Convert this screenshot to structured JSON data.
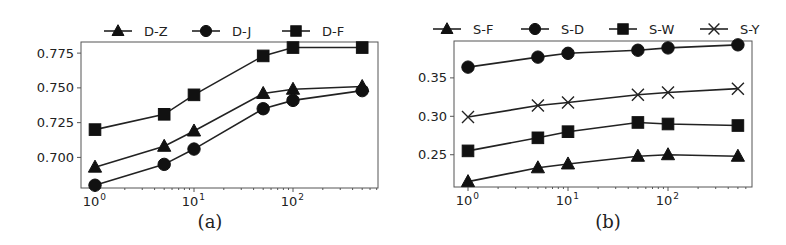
{
  "chart_data": [
    {
      "id": "a",
      "type": "line",
      "caption": "(a)",
      "title": "",
      "xlabel": "",
      "ylabel": "",
      "xscale": "log",
      "x": [
        1,
        5,
        10,
        50,
        100,
        500
      ],
      "x_ticks": [
        {
          "value": 1,
          "label": "10",
          "exp": "0"
        },
        {
          "value": 10,
          "label": "10",
          "exp": "1"
        },
        {
          "value": 100,
          "label": "10",
          "exp": "2"
        }
      ],
      "y_ticks": [
        0.7,
        0.725,
        0.75,
        0.775
      ],
      "y_tick_labels": [
        "0.700",
        "0.725",
        "0.750",
        "0.775"
      ],
      "ylim": [
        0.678,
        0.783
      ],
      "grid": false,
      "legend_position": "top, outside, horizontal",
      "series": [
        {
          "name": "D-Z",
          "marker": "triangle",
          "values": [
            0.693,
            0.708,
            0.719,
            0.746,
            0.749,
            0.751
          ]
        },
        {
          "name": "D-J",
          "marker": "circle",
          "values": [
            0.68,
            0.695,
            0.706,
            0.735,
            0.741,
            0.748
          ]
        },
        {
          "name": "D-F",
          "marker": "square",
          "values": [
            0.72,
            0.731,
            0.745,
            0.773,
            0.779,
            0.779
          ]
        }
      ]
    },
    {
      "id": "b",
      "type": "line",
      "caption": "(b)",
      "title": "",
      "xlabel": "",
      "ylabel": "",
      "xscale": "log",
      "x": [
        1,
        5,
        10,
        50,
        100,
        500
      ],
      "x_ticks": [
        {
          "value": 1,
          "label": "10",
          "exp": "0"
        },
        {
          "value": 10,
          "label": "10",
          "exp": "1"
        },
        {
          "value": 100,
          "label": "10",
          "exp": "2"
        }
      ],
      "y_ticks": [
        0.25,
        0.3,
        0.35
      ],
      "y_tick_labels": [
        "0.25",
        "0.30",
        "0.35"
      ],
      "ylim": [
        0.208,
        0.398
      ],
      "grid": false,
      "legend_position": "top, outside, horizontal",
      "series": [
        {
          "name": "S-F",
          "marker": "triangle",
          "values": [
            0.215,
            0.233,
            0.238,
            0.248,
            0.25,
            0.248
          ]
        },
        {
          "name": "S-D",
          "marker": "circle",
          "values": [
            0.364,
            0.377,
            0.382,
            0.386,
            0.389,
            0.393
          ]
        },
        {
          "name": "S-W",
          "marker": "square",
          "values": [
            0.255,
            0.272,
            0.28,
            0.292,
            0.29,
            0.288
          ]
        },
        {
          "name": "S-Y",
          "marker": "x",
          "values": [
            0.299,
            0.314,
            0.318,
            0.328,
            0.331,
            0.336
          ]
        }
      ]
    }
  ],
  "layout": {
    "panels": [
      {
        "frame": [
          81,
          42,
          378,
          188
        ],
        "x_decade_px": 99,
        "x_origin_px": 95,
        "legend_y": 31,
        "legend_x": [
          104,
          192,
          282
        ],
        "caption_xy": [
          210,
          228
        ]
      },
      {
        "frame": [
          454,
          41,
          752,
          187
        ],
        "x_decade_px": 100,
        "x_origin_px": 468,
        "legend_y": 29,
        "legend_x": [
          433,
          521,
          609,
          700
        ],
        "caption_xy": [
          608,
          228
        ]
      }
    ]
  }
}
